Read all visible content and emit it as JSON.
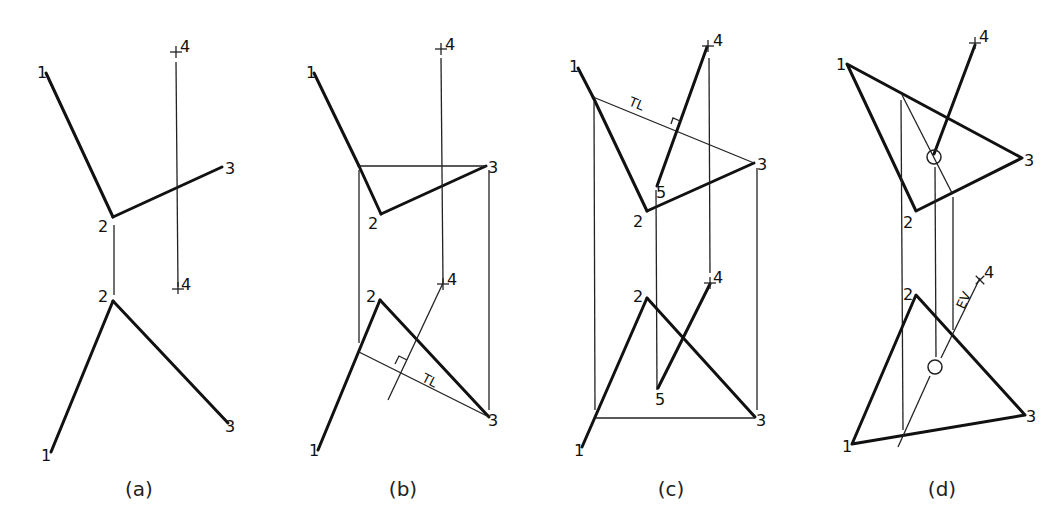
{
  "figure": {
    "type": "descriptive-geometry-construction",
    "panels": [
      {
        "caption": "(a)",
        "labels": {
          "p1_top": "1",
          "p2_top": "2",
          "p3_top": "3",
          "p4_top": "4",
          "p1_bot": "1",
          "p2_bot": "2",
          "p3_bot": "3",
          "p4_bot": "4"
        }
      },
      {
        "caption": "(b)",
        "labels": {
          "p1_top": "1",
          "p2_top": "2",
          "p3_top": "3",
          "p4_top": "4",
          "p1_bot": "1",
          "p2_bot": "2",
          "p3_bot": "3",
          "p4_bot": "4",
          "tl": "TL"
        }
      },
      {
        "caption": "(c)",
        "labels": {
          "p1_top": "1",
          "p2_top": "2",
          "p3_top": "3",
          "p4_top": "4",
          "p5_top": "5",
          "p1_bot": "1",
          "p2_bot": "2",
          "p3_bot": "3",
          "p4_bot": "4",
          "p5_bot": "5",
          "tl": "TL"
        }
      },
      {
        "caption": "(d)",
        "labels": {
          "p1_top": "1",
          "p2_top": "2",
          "p3_top": "3",
          "p4_top": "4",
          "p1_bot": "1",
          "p2_bot": "2",
          "p3_bot": "3",
          "p4_bot": "4",
          "ev": "EV"
        }
      }
    ]
  }
}
